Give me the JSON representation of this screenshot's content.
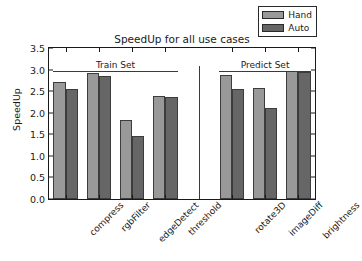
{
  "chart_data": {
    "type": "bar",
    "title": "SpeedUp for all use cases",
    "xlabel": "",
    "ylabel": "SpeedUp",
    "categories": [
      "compress",
      "rgbFilter",
      "edgeDetect",
      "threshold",
      "rotate3D",
      "imageDiff",
      "brightness"
    ],
    "series": [
      {
        "name": "Hand",
        "color": "#999999",
        "values": [
          2.72,
          2.91,
          1.84,
          2.39,
          2.87,
          2.58,
          2.97
        ]
      },
      {
        "name": "Auto",
        "color": "#666666",
        "values": [
          2.54,
          2.86,
          1.47,
          2.36,
          2.56,
          2.11,
          2.95
        ]
      }
    ],
    "ylim": [
      0.0,
      3.5
    ],
    "yticks": [
      "0.0",
      "0.5",
      "1.0",
      "1.5",
      "2.0",
      "2.5",
      "3.0",
      "3.5"
    ],
    "ytick_values": [
      0.0,
      0.5,
      1.0,
      1.5,
      2.0,
      2.5,
      3.0,
      3.5
    ],
    "grid": false,
    "legend_position": "upper right",
    "annotations": [
      {
        "text": "Train Set",
        "group": "train",
        "categories": [
          "compress",
          "rgbFilter",
          "edgeDetect",
          "threshold"
        ]
      },
      {
        "text": "Predict Set",
        "group": "predict",
        "categories": [
          "rotate3D",
          "imageDiff",
          "brightness"
        ]
      }
    ],
    "separator": {
      "between": [
        "threshold",
        "rotate3D"
      ]
    }
  },
  "legend": {
    "items": [
      {
        "label": "Hand",
        "color": "#999999"
      },
      {
        "label": "Auto",
        "color": "#666666"
      }
    ]
  },
  "colors": {
    "hand": "#999999",
    "auto": "#666666",
    "axis": "#1a1a1a",
    "background": "#ffffff"
  }
}
